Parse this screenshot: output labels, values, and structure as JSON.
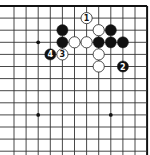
{
  "diagram": {
    "type": "go-board-fragment",
    "grid": {
      "x0": 14,
      "y0": 6,
      "spacing_x": 12.1,
      "spacing_y": 12.1,
      "cols": 12,
      "rows": 13,
      "top_edge": true,
      "right_edge": true,
      "left_edge": false,
      "bottom_edge": false,
      "line_color": "#333333",
      "edge_color": "#111111"
    },
    "star_points": [
      {
        "col": 2,
        "row": 3
      },
      {
        "col": 2,
        "row": 9
      },
      {
        "col": 8,
        "row": 9
      }
    ],
    "stones": [
      {
        "col": 6,
        "row": 1,
        "color": "white",
        "label": "1"
      },
      {
        "col": 4,
        "row": 2,
        "color": "black",
        "label": ""
      },
      {
        "col": 7,
        "row": 2,
        "color": "white",
        "label": ""
      },
      {
        "col": 8,
        "row": 2,
        "color": "black",
        "label": ""
      },
      {
        "col": 4,
        "row": 3,
        "color": "black",
        "label": ""
      },
      {
        "col": 5,
        "row": 3,
        "color": "white",
        "label": ""
      },
      {
        "col": 6,
        "row": 3,
        "color": "white",
        "label": ""
      },
      {
        "col": 7,
        "row": 3,
        "color": "black",
        "label": ""
      },
      {
        "col": 8,
        "row": 3,
        "color": "black",
        "label": ""
      },
      {
        "col": 9,
        "row": 3,
        "color": "black",
        "label": ""
      },
      {
        "col": 3,
        "row": 4,
        "color": "black",
        "label": "4"
      },
      {
        "col": 4,
        "row": 4,
        "color": "white",
        "label": "3"
      },
      {
        "col": 7,
        "row": 4,
        "color": "white",
        "label": ""
      },
      {
        "col": 7,
        "row": 5,
        "color": "white",
        "label": ""
      },
      {
        "col": 9,
        "row": 5,
        "color": "black",
        "label": "2"
      }
    ],
    "colors": {
      "black_stone": "#111111",
      "white_stone": "#ffffff",
      "stone_outline": "#222222"
    }
  }
}
